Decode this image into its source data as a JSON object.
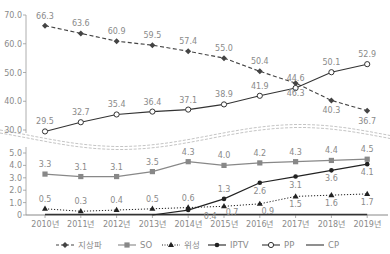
{
  "chart_data": {
    "type": "line",
    "title": "",
    "xlabel": "",
    "ylabel": "",
    "categories": [
      "2010년",
      "2011년",
      "2012년",
      "2013년",
      "2014년",
      "2015년",
      "2016년",
      "2017년",
      "2018년",
      "2019년"
    ],
    "axis_break": true,
    "upper_panel": {
      "ylim": [
        30.0,
        70.0
      ],
      "yticks": [
        "70.0",
        "60.0",
        "50.0",
        "40.0",
        "30.0"
      ],
      "series": [
        {
          "name": "지상파",
          "style": "dashed",
          "marker": "filled-diamond",
          "values": [
            66.3,
            63.6,
            60.9,
            59.5,
            57.4,
            55.0,
            50.4,
            46.3,
            40.3,
            36.7
          ]
        },
        {
          "name": "PP",
          "style": "solid",
          "marker": "open-circle",
          "values": [
            29.5,
            32.7,
            35.4,
            36.4,
            37.1,
            38.9,
            41.9,
            44.6,
            50.1,
            52.9
          ]
        }
      ]
    },
    "lower_panel": {
      "ylim": [
        0,
        5.0
      ],
      "yticks": [
        "5.0",
        "4.0",
        "3.0",
        "2.0",
        "1.0",
        "0"
      ],
      "series": [
        {
          "name": "SO",
          "style": "solid",
          "marker": "filled-square",
          "values": [
            3.3,
            3.1,
            3.1,
            3.5,
            4.3,
            4.0,
            4.2,
            4.3,
            4.4,
            4.5
          ]
        },
        {
          "name": "위성",
          "style": "dotted",
          "marker": "filled-triangle",
          "values": [
            0.5,
            0.3,
            0.4,
            0.5,
            0.6,
            0.7,
            0.9,
            1.5,
            1.6,
            1.7
          ]
        },
        {
          "name": "IPTV",
          "style": "solid",
          "marker": "filled-circle",
          "values": [
            0.0,
            0.0,
            0.0,
            0.0,
            0.4,
            1.3,
            2.6,
            3.1,
            3.6,
            4.1
          ]
        },
        {
          "name": "CP",
          "style": "solid",
          "marker": "none",
          "values": [
            0,
            0,
            0,
            0,
            0,
            0,
            0,
            0,
            0,
            0
          ]
        }
      ]
    },
    "legend": {
      "position": "bottom",
      "entries": [
        "지상파",
        "SO",
        "위성",
        "IPTV",
        "PP",
        "CP"
      ]
    }
  }
}
